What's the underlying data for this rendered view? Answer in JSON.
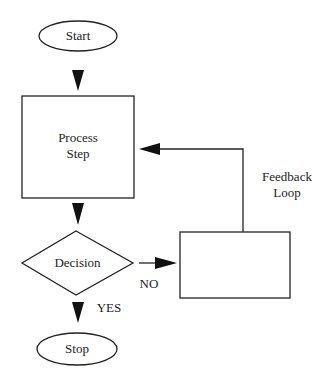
{
  "diagram": {
    "nodes": {
      "start": {
        "label": "Start",
        "shape": "ellipse"
      },
      "process": {
        "label_line1": "Process",
        "label_line2": "Step",
        "shape": "rectangle"
      },
      "decision": {
        "label": "Decision",
        "shape": "diamond"
      },
      "stop": {
        "label": "Stop",
        "shape": "ellipse"
      },
      "feedback_box": {
        "label": "",
        "shape": "rectangle"
      }
    },
    "edges": {
      "yes_label": "YES",
      "no_label": "NO",
      "feedback_line1": "Feedback",
      "feedback_line2": "Loop"
    },
    "colors": {
      "stroke": "#222222",
      "fill": "#ffffff"
    }
  }
}
